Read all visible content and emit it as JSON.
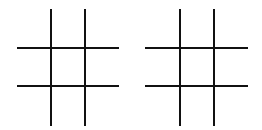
{
  "boards": [
    {
      "id": "board-left",
      "cells": [
        "",
        "",
        "",
        "",
        "",
        "",
        "",
        "",
        ""
      ],
      "line_color": "#111111",
      "v_lines_x": [
        51,
        85
      ],
      "h_lines_y": [
        48,
        86
      ],
      "x_range": [
        17,
        119
      ],
      "y_range": [
        9,
        126
      ]
    },
    {
      "id": "board-right",
      "cells": [
        "",
        "",
        "",
        "",
        "",
        "",
        "",
        "",
        ""
      ],
      "line_color": "#111111",
      "v_lines_x": [
        180,
        214
      ],
      "h_lines_y": [
        48,
        86
      ],
      "x_range": [
        145,
        248
      ],
      "y_range": [
        9,
        126
      ]
    }
  ]
}
